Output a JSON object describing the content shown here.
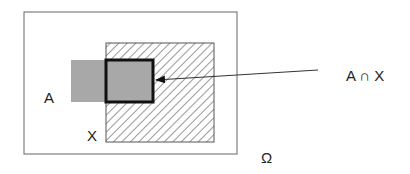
{
  "diagram": {
    "universe_label": "Ω",
    "set_a_label": "A",
    "set_x_label": "X",
    "intersection_label": "A ∩ X",
    "colors": {
      "set_a_fill": "#a8a8a8",
      "outline": "#555555",
      "intersection_border": "#111111",
      "hatch": "#333333"
    }
  }
}
